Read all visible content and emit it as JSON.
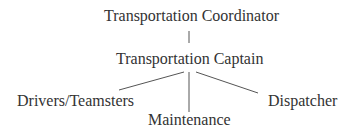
{
  "chart": {
    "root": {
      "label": "Transportation Coordinator"
    },
    "level1": {
      "label": "Transportation Captain"
    },
    "children": [
      {
        "label": "Drivers/Teamsters"
      },
      {
        "label": "Maintenance"
      },
      {
        "label": "Dispatcher"
      }
    ]
  },
  "colors": {
    "text": "#333333",
    "line": "#555555",
    "background": "#ffffff"
  }
}
